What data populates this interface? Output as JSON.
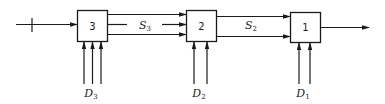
{
  "diagram": {
    "type": "multistage serial system block diagram",
    "stages": [
      {
        "id": "stage-3",
        "label": "3",
        "decision_label": "D",
        "decision_sub": "3",
        "decision_inputs": 3
      },
      {
        "id": "stage-2",
        "label": "2",
        "decision_label": "D",
        "decision_sub": "2",
        "decision_inputs": 2
      },
      {
        "id": "stage-1",
        "label": "1",
        "decision_label": "D",
        "decision_sub": "1",
        "decision_inputs": 2
      }
    ],
    "states": [
      {
        "id": "S3",
        "label": "S",
        "sub": "3",
        "between": [
          "3",
          "2"
        ],
        "arrows": 3
      },
      {
        "id": "S2",
        "label": "S",
        "sub": "2",
        "between": [
          "2",
          "1"
        ],
        "arrows": 2
      }
    ],
    "input": {
      "arrows": 1,
      "has_tick_mark": true
    },
    "output": {
      "arrows": 1
    },
    "colors": {
      "stroke": "#1a1a1a",
      "background": "#ffffff"
    }
  }
}
